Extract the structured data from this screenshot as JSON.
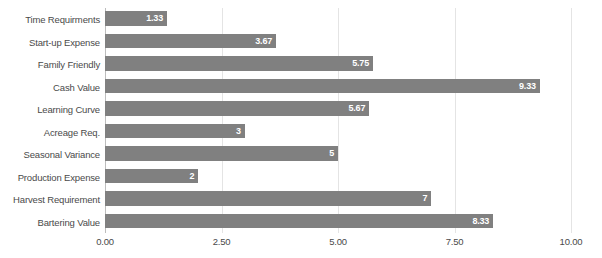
{
  "chart_data": {
    "type": "bar",
    "orientation": "horizontal",
    "title": "",
    "xlabel": "",
    "ylabel": "",
    "xlim": [
      0,
      10
    ],
    "grid": true,
    "legend": false,
    "xticks": [
      "0.00",
      "2.50",
      "5.00",
      "7.50",
      "10.00"
    ],
    "xtick_values": [
      0,
      2.5,
      5,
      7.5,
      10
    ],
    "categories": [
      "Time Requirments",
      "Start-up Expense",
      "Family Friendly",
      "Cash Value",
      "Learning Curve",
      "Acreage Req.",
      "Seasonal Variance",
      "Production Expense",
      "Harvest Requirement",
      "Bartering Value"
    ],
    "values": [
      1.33,
      3.67,
      5.75,
      9.33,
      5.67,
      3,
      5,
      2,
      7,
      8.33
    ],
    "data_labels": [
      "1.33",
      "3.67",
      "5.75",
      "9.33",
      "5.67",
      "3",
      "5",
      "2",
      "7",
      "8.33"
    ],
    "colors": {
      "bar": "#808080",
      "gridline": "#e4e4e4",
      "axis": "#bdbdbd",
      "label_text": "#4a4a4a",
      "value_text": "#ffffff",
      "background": "#ffffff"
    }
  }
}
